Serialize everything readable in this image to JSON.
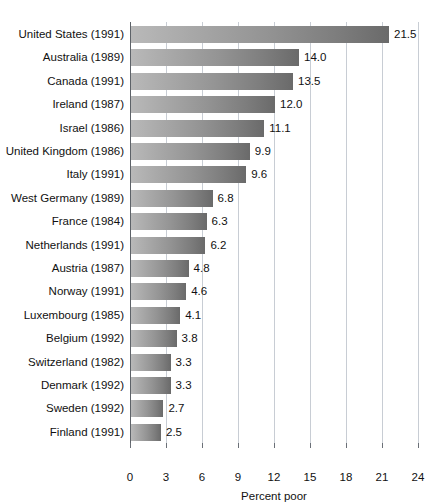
{
  "chart_data": {
    "type": "bar",
    "orientation": "horizontal",
    "title": "",
    "xlabel": "Percent poor",
    "ylabel": "",
    "xlim": [
      0,
      24
    ],
    "xticks": [
      0,
      3,
      6,
      9,
      12,
      15,
      18,
      21,
      24
    ],
    "grid": true,
    "legend": false,
    "categories": [
      "United States (1991)",
      "Australia (1989)",
      "Canada (1991)",
      "Ireland (1987)",
      "Israel (1986)",
      "United Kingdom (1986)",
      "Italy (1991)",
      "West Germany (1989)",
      "France (1984)",
      "Netherlands (1991)",
      "Austria (1987)",
      "Norway (1991)",
      "Luxembourg (1985)",
      "Belgium (1992)",
      "Switzerland (1982)",
      "Denmark (1992)",
      "Sweden (1992)",
      "Finland (1991)"
    ],
    "values": [
      21.5,
      14.0,
      13.5,
      12.0,
      11.1,
      9.9,
      9.6,
      6.8,
      6.3,
      6.2,
      4.8,
      4.6,
      4.1,
      3.8,
      3.3,
      3.3,
      2.7,
      2.5
    ],
    "value_labels": [
      "21.5",
      "14.0",
      "13.5",
      "12.0",
      "11.1",
      "9.9",
      "9.6",
      "6.8",
      "6.3",
      "6.2",
      "4.8",
      "4.6",
      "4.1",
      "3.8",
      "3.3",
      "3.3",
      "2.7",
      "2.5"
    ],
    "bar_color_light": "#b9b9b9",
    "bar_color_dark": "#6a6a6a",
    "gridline_color": "#c8cdd4",
    "axis_color": "#5d6268",
    "background": "#ffffff"
  }
}
